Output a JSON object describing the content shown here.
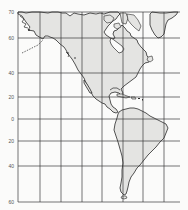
{
  "map": {
    "title": "",
    "region": "Americas",
    "projection_hint": "Mercator-style grid",
    "colors": {
      "land": "#e4e4e2",
      "water": "#fbfbfa",
      "grid": "#3a3a3a",
      "coast": "#2a2a2a"
    },
    "latitude_labels": [
      {
        "label": "70",
        "y": 12
      },
      {
        "label": "60",
        "y": 38
      },
      {
        "label": "40",
        "y": 73
      },
      {
        "label": "20",
        "y": 97
      },
      {
        "label": "0",
        "y": 119
      },
      {
        "label": "20",
        "y": 141
      },
      {
        "label": "40",
        "y": 166
      },
      {
        "label": "60",
        "y": 202
      }
    ],
    "grid": {
      "horizontal_y": [
        12,
        38,
        73,
        97,
        119,
        141,
        166,
        202
      ],
      "vertical_x": [
        18,
        40,
        61,
        82,
        102,
        123,
        143,
        164
      ],
      "left": 18,
      "right": 180,
      "top": 12,
      "bottom": 202
    },
    "features": [
      {
        "name": "North America",
        "type": "continent"
      },
      {
        "name": "Central America",
        "type": "isthmus"
      },
      {
        "name": "South America",
        "type": "continent"
      },
      {
        "name": "Greenland",
        "type": "island"
      },
      {
        "name": "Caribbean islands",
        "type": "islands"
      },
      {
        "name": "Aleutian chain",
        "type": "dashed-islands"
      }
    ]
  }
}
